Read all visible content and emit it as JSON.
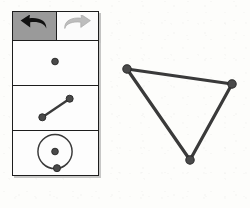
{
  "app": {
    "title": "Geometry Sketch Palette"
  },
  "colors": {
    "ink": "#1d1d1d",
    "stroke": "#3a3a3a",
    "point_fill": "#4a4a4a",
    "pressed_background": "#9a9a9a",
    "button_background": "#fbfbfb",
    "panel_background": "#fdfdfd",
    "page_background": "#fdfdfb",
    "undo_arrow": "#111111",
    "redo_arrow": "#b9b9b9"
  },
  "toolbar": {
    "buttons": [
      {
        "name": "undo",
        "label": "Undo",
        "icon": "undo-arrow-icon",
        "state": "pressed"
      },
      {
        "name": "redo",
        "label": "Redo",
        "icon": "redo-arrow-icon",
        "state": "normal"
      }
    ]
  },
  "palette": {
    "panels": [
      {
        "name": "point-tool",
        "label": "Point",
        "icon": "point-icon",
        "selected": false,
        "geometry": {
          "points": [
            {
              "x": 43,
              "y": 21,
              "r": 3.4
            }
          ]
        }
      },
      {
        "name": "segment-tool",
        "label": "Segment",
        "icon": "segment-icon",
        "selected": false,
        "geometry": {
          "points": [
            {
              "x": 30,
              "y": 32,
              "r": 3.6
            },
            {
              "x": 58,
              "y": 13,
              "r": 3.6
            }
          ],
          "segments": [
            {
              "x1": 30,
              "y1": 32,
              "x2": 58,
              "y2": 13
            }
          ]
        }
      },
      {
        "name": "circle-tool",
        "label": "Circle",
        "icon": "circle-icon",
        "selected": false,
        "geometry": {
          "circles": [
            {
              "cx": 43,
              "cy": 21,
              "r": 17.5
            }
          ],
          "points": [
            {
              "x": 43,
              "y": 21,
              "r": 3.4
            },
            {
              "x": 45,
              "y": 38,
              "r": 3.6
            }
          ]
        }
      }
    ]
  },
  "canvas": {
    "name": "sketch-canvas",
    "shape": "triangle",
    "vertices": [
      {
        "id": "A",
        "x": 17,
        "y": 19
      },
      {
        "id": "B",
        "x": 122,
        "y": 34
      },
      {
        "id": "C",
        "x": 80,
        "y": 110
      }
    ],
    "edges": [
      {
        "from": "A",
        "to": "B"
      },
      {
        "from": "B",
        "to": "C"
      },
      {
        "from": "C",
        "to": "A"
      }
    ],
    "point_radius": 4.2,
    "stroke_width": 3.2
  }
}
